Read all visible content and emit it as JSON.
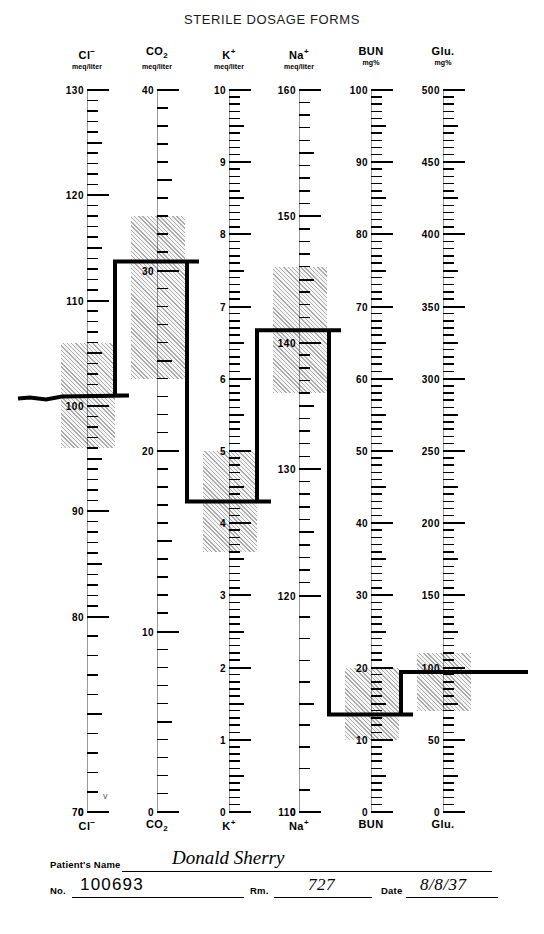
{
  "title": "STERILE DOSAGE FORMS",
  "stray_mark": "v",
  "chart_data": {
    "type": "line",
    "title": "STERILE DOSAGE FORMS",
    "xlabel": "",
    "ylabel": "",
    "grid": false,
    "legend": "none",
    "categories": [
      "Cl⁻",
      "CO₂",
      "K⁺",
      "Na⁺",
      "BUN",
      "Glu."
    ],
    "values": [
      101,
      30.5,
      4.3,
      141,
      13.5,
      97
    ],
    "series": [
      {
        "name": "Patient values",
        "values": [
          101,
          30.5,
          4.3,
          141,
          13.5,
          97
        ]
      }
    ],
    "columns": [
      {
        "symbol": "Cl",
        "charge": "−",
        "charge_pos": "sup",
        "label": "Cl⁻",
        "unit": "meq/liter",
        "axis_top_value": 130,
        "axis_labels": [
          "130",
          "120",
          "110",
          "100",
          "90",
          "80",
          "70",
          "0"
        ],
        "axis_values": [
          130,
          120,
          110,
          100,
          90,
          80,
          70,
          0
        ],
        "broken_axis": true,
        "minor_step": 2,
        "value": 101,
        "normal_low": 96,
        "normal_high": 106
      },
      {
        "symbol": "CO",
        "charge": "2",
        "charge_pos": "sub",
        "label": "CO₂",
        "unit": "meq/liter",
        "axis_top_value": 40,
        "axis_labels": [
          "40",
          "30",
          "20",
          "10",
          "0"
        ],
        "axis_values": [
          40,
          30,
          20,
          10,
          0
        ],
        "broken_axis": false,
        "minor_step": 1,
        "value": 30.5,
        "normal_low": 24,
        "normal_high": 33
      },
      {
        "symbol": "K",
        "charge": "+",
        "charge_pos": "sup",
        "label": "K⁺",
        "unit": "meq/liter",
        "axis_top_value": 10,
        "axis_labels": [
          "10",
          "9",
          "8",
          "7",
          "6",
          "5",
          "4",
          "3",
          "2",
          "1",
          "0"
        ],
        "axis_values": [
          10,
          9,
          8,
          7,
          6,
          5,
          4,
          3,
          2,
          1,
          0
        ],
        "broken_axis": false,
        "minor_step": 0.2,
        "value": 4.3,
        "normal_low": 3.6,
        "normal_high": 5.0
      },
      {
        "symbol": "Na",
        "charge": "+",
        "charge_pos": "sup",
        "label": "Na⁺",
        "unit": "meq/liter",
        "axis_top_value": 160,
        "axis_labels": [
          "160",
          "150",
          "140",
          "130",
          "120",
          "110",
          "0"
        ],
        "axis_values": [
          160,
          150,
          140,
          130,
          120,
          110,
          0
        ],
        "broken_axis": true,
        "minor_step": 2,
        "value": 141,
        "normal_low": 136,
        "normal_high": 146
      },
      {
        "symbol": "BUN",
        "charge": "",
        "charge_pos": "none",
        "label": "BUN",
        "unit": "mg%",
        "axis_top_value": 100,
        "axis_labels": [
          "100",
          "90",
          "80",
          "70",
          "60",
          "50",
          "40",
          "30",
          "20",
          "10",
          "0"
        ],
        "axis_values": [
          100,
          90,
          80,
          70,
          60,
          50,
          40,
          30,
          20,
          10,
          0
        ],
        "broken_axis": false,
        "minor_step": 2,
        "value": 13.5,
        "normal_low": 10,
        "normal_high": 20
      },
      {
        "symbol": "Glu.",
        "charge": "",
        "charge_pos": "none",
        "label": "Glu.",
        "unit": "mg%",
        "axis_top_value": 500,
        "axis_labels": [
          "500",
          "450",
          "400",
          "350",
          "300",
          "250",
          "200",
          "150",
          "100",
          "50",
          "0"
        ],
        "axis_values": [
          500,
          450,
          400,
          350,
          300,
          250,
          200,
          150,
          100,
          50,
          0
        ],
        "broken_axis": false,
        "minor_step": 10,
        "value": 97,
        "normal_low": 70,
        "normal_high": 110
      }
    ]
  },
  "form": {
    "name_label": "Patient's Name",
    "name_value": "Donald Sherry",
    "no_label": "No.",
    "no_value": "100693",
    "room_label": "Rm.",
    "room_value": "727",
    "date_label": "Date",
    "date_value": "8/8/37"
  }
}
